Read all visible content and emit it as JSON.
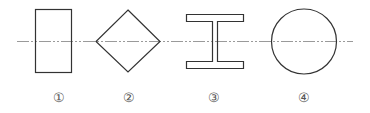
{
  "diagram": {
    "type": "cross-section shapes on a common centerline",
    "stroke_color": "#333333",
    "centerline_color": "#999999",
    "centerline_style": "dash-dot",
    "shapes": [
      {
        "id": 1,
        "shape": "rectangle",
        "label": "①"
      },
      {
        "id": 2,
        "shape": "diamond",
        "label": "②"
      },
      {
        "id": 3,
        "shape": "I-beam",
        "label": "③"
      },
      {
        "id": 4,
        "shape": "circle",
        "label": "④"
      }
    ]
  }
}
